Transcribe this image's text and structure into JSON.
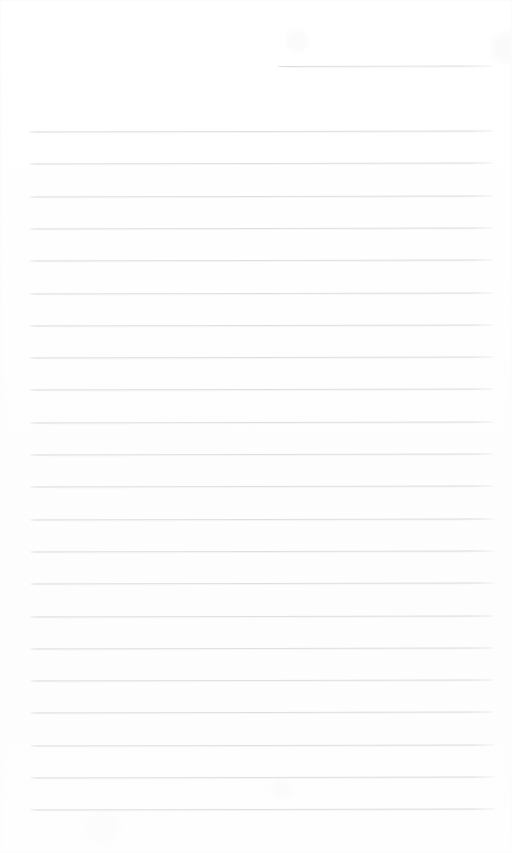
{
  "document": {
    "kind": "scanned-lined-paper",
    "title": "Blank Lined Notebook Page",
    "page_width": 512,
    "page_height": 853,
    "background_color": "#fefefe",
    "rule_color": "#e0e0e2",
    "rule_color_dark": "#d6d6d8",
    "rule_thickness_px": 1,
    "rule_spacing_px": 32.3,
    "skew_degrees": -0.13,
    "written_text": "",
    "margin_left_px": 30,
    "margin_right_px": 493,
    "has_header_text": false,
    "has_footer_text": false,
    "has_page_number": false,
    "has_margin_rule": false
  },
  "rules": [
    {
      "id": "rule-00",
      "type": "short",
      "y": 66,
      "x_start": 278,
      "x_end": 493,
      "text": ""
    },
    {
      "id": "rule-01",
      "type": "full",
      "y": 131,
      "x_start": 30,
      "x_end": 493,
      "text": ""
    },
    {
      "id": "rule-02",
      "type": "full",
      "y": 163.3,
      "x_start": 30,
      "x_end": 493,
      "text": ""
    },
    {
      "id": "rule-03",
      "type": "full",
      "y": 195.6,
      "x_start": 30,
      "x_end": 493,
      "text": ""
    },
    {
      "id": "rule-04",
      "type": "full",
      "y": 227.9,
      "x_start": 30,
      "x_end": 493,
      "text": ""
    },
    {
      "id": "rule-05",
      "type": "full",
      "y": 260.2,
      "x_start": 30,
      "x_end": 493,
      "text": ""
    },
    {
      "id": "rule-06",
      "type": "full",
      "y": 292.5,
      "x_start": 30,
      "x_end": 493,
      "text": ""
    },
    {
      "id": "rule-07",
      "type": "full",
      "y": 324.8,
      "x_start": 30,
      "x_end": 493,
      "text": ""
    },
    {
      "id": "rule-08",
      "type": "full",
      "y": 357.1,
      "x_start": 30,
      "x_end": 493,
      "text": ""
    },
    {
      "id": "rule-09",
      "type": "full",
      "y": 389.4,
      "x_start": 30,
      "x_end": 493,
      "text": ""
    },
    {
      "id": "rule-10",
      "type": "full",
      "y": 421.7,
      "x_start": 30,
      "x_end": 493,
      "text": ""
    },
    {
      "id": "rule-11",
      "type": "full",
      "y": 454.0,
      "x_start": 30,
      "x_end": 493,
      "text": ""
    },
    {
      "id": "rule-12",
      "type": "full",
      "y": 486.3,
      "x_start": 30,
      "x_end": 493,
      "text": ""
    },
    {
      "id": "rule-13",
      "type": "full",
      "y": 518.6,
      "x_start": 30,
      "x_end": 493,
      "text": ""
    },
    {
      "id": "rule-14",
      "type": "full",
      "y": 550.9,
      "x_start": 30,
      "x_end": 493,
      "text": ""
    },
    {
      "id": "rule-15",
      "type": "full",
      "y": 583.2,
      "x_start": 30,
      "x_end": 493,
      "text": ""
    },
    {
      "id": "rule-16",
      "type": "full",
      "y": 615.5,
      "x_start": 30,
      "x_end": 493,
      "text": ""
    },
    {
      "id": "rule-17",
      "type": "full",
      "y": 647.8,
      "x_start": 30,
      "x_end": 493,
      "text": ""
    },
    {
      "id": "rule-18",
      "type": "full",
      "y": 680.1,
      "x_start": 30,
      "x_end": 493,
      "text": ""
    },
    {
      "id": "rule-19",
      "type": "full",
      "y": 712.4,
      "x_start": 30,
      "x_end": 493,
      "text": ""
    },
    {
      "id": "rule-20",
      "type": "full",
      "y": 744.7,
      "x_start": 30,
      "x_end": 493,
      "text": ""
    },
    {
      "id": "rule-21",
      "type": "full",
      "y": 777.0,
      "x_start": 30,
      "x_end": 493,
      "text": ""
    },
    {
      "id": "rule-22",
      "type": "full",
      "y": 809.3,
      "x_start": 30,
      "x_end": 493,
      "text": ""
    }
  ]
}
